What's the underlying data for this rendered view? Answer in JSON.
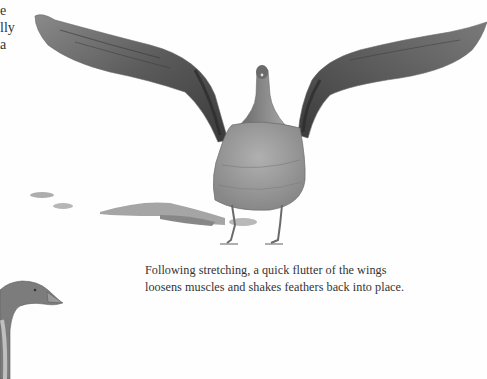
{
  "page": {
    "left_column_fragments": [
      "e",
      "lly",
      "a"
    ],
    "caption": {
      "line1": "Following stretching, a quick flutter of the wings",
      "line2": "loosens muscles and shakes feathers back into place."
    },
    "illustrations": [
      {
        "name": "goose-wings-spread",
        "description": "Watercolor goose facing viewer with both wings raised"
      },
      {
        "name": "goose-head-partial",
        "description": "Partial goose head and neck, bottom-left"
      }
    ],
    "colors": {
      "background": "#fefefe",
      "text": "#333333",
      "wing_dark": "#4a4a4a",
      "wing_mid": "#7a7a7a",
      "body": "#9a9a9a",
      "shadow": "#8c8c8c"
    }
  }
}
